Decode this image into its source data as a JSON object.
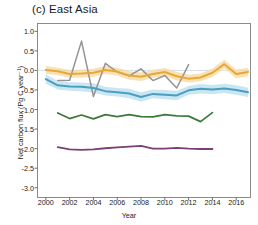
{
  "chart_data": {
    "type": "line",
    "title": "(c) East Asia",
    "subtitle": "",
    "xlabel": "Year",
    "ylabel": "Net carbon flux  (Pg C year⁻¹)",
    "ylabel_plain": "Net carbon flux (Pg C year-1)",
    "xlim": [
      1999.3,
      2017.2
    ],
    "ylim": [
      -3.25,
      1.2
    ],
    "xticks": [
      2000,
      2002,
      2004,
      2006,
      2008,
      2010,
      2012,
      2014,
      2016
    ],
    "xtick_labels": [
      "2000",
      "2002",
      "2004",
      "2006",
      "2008",
      "2010",
      "2012",
      "2014",
      "2016"
    ],
    "yticks": [
      1.0,
      0.5,
      0.0,
      -0.5,
      -1.0,
      -1.5,
      -2.0,
      -2.5,
      -3.0
    ],
    "ytick_labels": [
      "1.0",
      "0.5",
      "0.0",
      "-0.5",
      "-1.0",
      "-1.5",
      "-2.0",
      "-2.5",
      "-3.0"
    ],
    "grid": false,
    "zero_reference_line": 0.0,
    "legend_position": "none",
    "series": [
      {
        "name": "gray-series",
        "color": "#949494",
        "band": false,
        "band_color": "",
        "linewidth": 1.5,
        "x": [
          2001,
          2002,
          2003,
          2004,
          2005,
          2006,
          2007,
          2008,
          2009,
          2010,
          2011,
          2012
        ],
        "values": [
          -0.26,
          -0.25,
          0.75,
          -0.67,
          0.18,
          -0.04,
          -0.14,
          0.04,
          -0.26,
          -0.13,
          -0.45,
          0.15
        ]
      },
      {
        "name": "orange-series",
        "color": "#e8a838",
        "band": true,
        "band_color": "#f6d79a",
        "linewidth": 2.0,
        "x": [
          2000,
          2001,
          2002,
          2003,
          2004,
          2005,
          2006,
          2007,
          2008,
          2009,
          2010,
          2011,
          2012,
          2013,
          2014,
          2015,
          2016,
          2017
        ],
        "values": [
          0.01,
          -0.02,
          -0.09,
          -0.08,
          -0.06,
          0.01,
          -0.03,
          -0.13,
          -0.16,
          -0.09,
          -0.04,
          -0.15,
          -0.21,
          -0.18,
          -0.06,
          0.16,
          -0.09,
          -0.04
        ],
        "band_upper": [
          0.11,
          0.07,
          0.01,
          0.02,
          0.04,
          0.11,
          0.07,
          -0.02,
          -0.05,
          0.01,
          0.06,
          -0.04,
          -0.11,
          -0.08,
          0.05,
          0.27,
          0.02,
          0.07
        ],
        "band_lower": [
          -0.09,
          -0.12,
          -0.19,
          -0.18,
          -0.16,
          -0.09,
          -0.13,
          -0.24,
          -0.27,
          -0.19,
          -0.14,
          -0.26,
          -0.31,
          -0.28,
          -0.17,
          0.05,
          -0.2,
          -0.15
        ]
      },
      {
        "name": "blue-series",
        "color": "#4a9fc0",
        "band": true,
        "band_color": "#b8ddee",
        "linewidth": 2.0,
        "x": [
          2000,
          2001,
          2002,
          2003,
          2004,
          2005,
          2006,
          2007,
          2008,
          2009,
          2010,
          2011,
          2012,
          2013,
          2014,
          2015,
          2016,
          2017
        ],
        "values": [
          -0.22,
          -0.38,
          -0.41,
          -0.42,
          -0.45,
          -0.53,
          -0.56,
          -0.59,
          -0.68,
          -0.6,
          -0.62,
          -0.64,
          -0.51,
          -0.47,
          -0.49,
          -0.46,
          -0.5,
          -0.56
        ],
        "band_upper": [
          -0.1,
          -0.27,
          -0.3,
          -0.31,
          -0.33,
          -0.42,
          -0.45,
          -0.47,
          -0.56,
          -0.49,
          -0.5,
          -0.52,
          -0.4,
          -0.35,
          -0.37,
          -0.34,
          -0.38,
          -0.44
        ],
        "band_lower": [
          -0.34,
          -0.49,
          -0.52,
          -0.53,
          -0.57,
          -0.64,
          -0.67,
          -0.71,
          -0.8,
          -0.71,
          -0.74,
          -0.76,
          -0.62,
          -0.59,
          -0.61,
          -0.58,
          -0.62,
          -0.68
        ]
      },
      {
        "name": "green-series",
        "color": "#3d7a3a",
        "band": false,
        "band_color": "",
        "linewidth": 1.8,
        "x": [
          2001,
          2002,
          2003,
          2004,
          2005,
          2006,
          2007,
          2008,
          2009,
          2010,
          2011,
          2012,
          2013,
          2014
        ],
        "values": [
          -1.09,
          -1.23,
          -1.14,
          -1.24,
          -1.13,
          -1.18,
          -1.13,
          -1.18,
          -1.19,
          -1.13,
          -1.16,
          -1.17,
          -1.31,
          -1.08
        ]
      },
      {
        "name": "purple-series",
        "color": "#7b3f78",
        "band": false,
        "band_color": "",
        "linewidth": 1.8,
        "x": [
          2001,
          2002,
          2003,
          2004,
          2005,
          2006,
          2007,
          2008,
          2009,
          2010,
          2011,
          2012,
          2013,
          2014
        ],
        "values": [
          -1.96,
          -2.02,
          -2.03,
          -2.02,
          -1.99,
          -1.97,
          -1.95,
          -1.93,
          -2.0,
          -2.0,
          -1.98,
          -2.0,
          -2.01,
          -2.01
        ]
      }
    ]
  }
}
